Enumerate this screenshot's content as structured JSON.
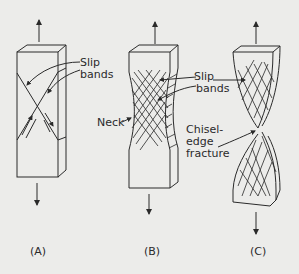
{
  "diagram": {
    "colors": {
      "background": "#ececea",
      "ink": "#2a2a2a"
    },
    "panels": [
      {
        "id": "A",
        "caption": "(A)",
        "labels": [
          "Slip",
          "bands"
        ]
      },
      {
        "id": "B",
        "caption": "(B)",
        "labels": [
          "Neck",
          "Slip",
          "bands"
        ]
      },
      {
        "id": "C",
        "caption": "(C)",
        "labels": [
          "Chisel-",
          "edge",
          "fracture"
        ]
      }
    ],
    "annotations": {
      "slip_a_1": "Slip",
      "slip_a_2": "bands",
      "slip_b_1": "Slip",
      "slip_b_2": "bands",
      "neck": "Neck",
      "chisel_1": "Chisel-",
      "chisel_2": "edge",
      "chisel_3": "fracture"
    },
    "captions": {
      "a": "(A)",
      "b": "(B)",
      "c": "(C)"
    },
    "icons": [
      "arrow-up-icon",
      "arrow-down-icon"
    ]
  }
}
